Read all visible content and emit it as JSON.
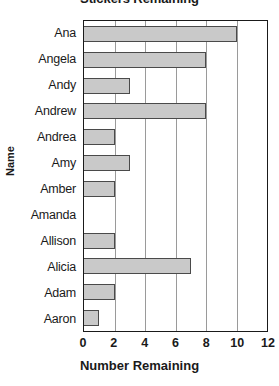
{
  "chart_data": {
    "type": "bar",
    "orientation": "horizontal",
    "title": "Stickers Remaining",
    "xlabel": "Number Remaining",
    "ylabel": "Name",
    "categories": [
      "Ana",
      "Angela",
      "Andy",
      "Andrew",
      "Andrea",
      "Amy",
      "Amber",
      "Amanda",
      "Allison",
      "Alicia",
      "Adam",
      "Aaron"
    ],
    "values": [
      10,
      8,
      3,
      8,
      2,
      3,
      2,
      0,
      2,
      7,
      2,
      1
    ],
    "xlim": [
      0,
      12
    ],
    "xticks": [
      0,
      2,
      4,
      6,
      8,
      10,
      12
    ],
    "xtick_labels": [
      "0",
      "2",
      "4",
      "6",
      "8",
      "10",
      "12"
    ],
    "grid": "vertical",
    "legend": "none",
    "bar_fill_color": "#c9c9c9",
    "bar_border_color": "#4a4a4a",
    "gridline_color": "#9a9a9a",
    "axis_color": "#1a1a1a",
    "background_color": "#ffffff"
  }
}
